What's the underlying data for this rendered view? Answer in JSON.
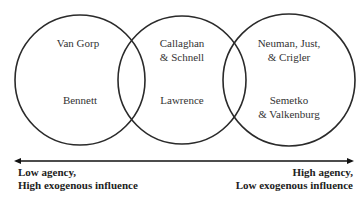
{
  "circles": [
    {
      "name": "low-agency-circle",
      "items": [
        "Van Gorp",
        "Bennett"
      ]
    },
    {
      "name": "mid-agency-circle",
      "items": [
        "Callaghan\n& Schnell",
        "Lawrence"
      ]
    },
    {
      "name": "high-agency-circle",
      "items": [
        "Neuman, Just,\n& Crigler",
        "Semetko\n& Valkenburg"
      ]
    }
  ],
  "labels": {
    "van_gorp": "Van Gorp",
    "bennett": "Bennett",
    "callaghan_1": "Callaghan",
    "callaghan_2": "& Schnell",
    "lawrence": "Lawrence",
    "neuman_1": "Neuman, Just,",
    "neuman_2": "& Crigler",
    "semetko_1": "Semetko",
    "semetko_2": "& Valkenburg"
  },
  "axis": {
    "left_line1": "Low agency,",
    "left_line2": "High exogenous influence",
    "right_line1": "High agency,",
    "right_line2": "Low exogenous influence"
  }
}
